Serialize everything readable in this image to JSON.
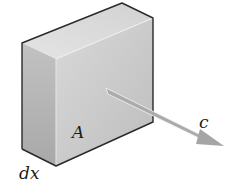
{
  "figure": {
    "type": "slab-volume-element",
    "labels": {
      "area": "A",
      "thickness": "dx",
      "velocity": "c"
    },
    "colors": {
      "front_face": "#c8c8c8",
      "top_face": "#dedede",
      "side_face": "#b4b4b4",
      "edge": "#2a2a2a",
      "arrow": "#a9a9a9"
    }
  }
}
